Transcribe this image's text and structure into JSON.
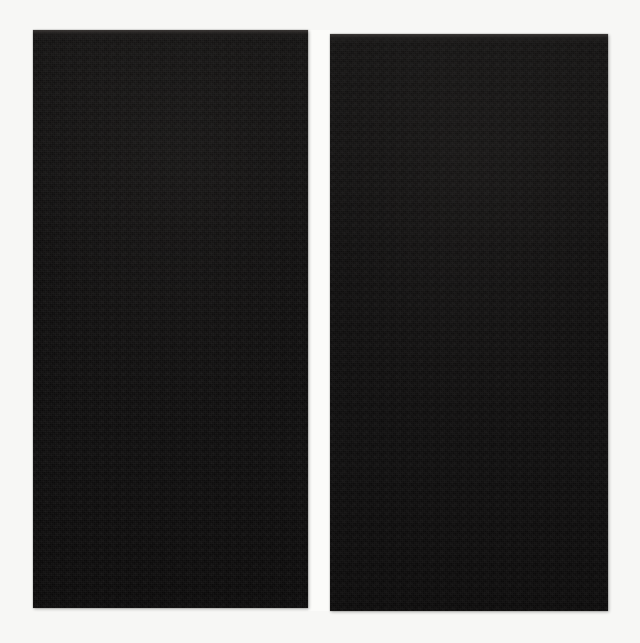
{
  "canvas": {
    "width": 640,
    "height": 643,
    "background_color": "#f7f7f5"
  },
  "scene": {
    "description": "Two tall near-black rectangular panels placed side by side on a plain off-white background, separated by a narrow white vertical gutter.",
    "panel_count": 2,
    "panel_fill_color": "#0d0c0c",
    "gutter_color": "#fbfbf9",
    "visible_text": ""
  },
  "panels": [
    {
      "id": "left",
      "label": "",
      "fill_color": "#0d0c0c",
      "top_edge_highlight_color": "#3e3a38",
      "content": "",
      "x": 33,
      "y": 30,
      "width": 275,
      "height": 578
    },
    {
      "id": "right",
      "label": "",
      "fill_color": "#0d0c0c",
      "top_edge_highlight_color": "#3e3a38",
      "content": "",
      "x": 330,
      "y": 34,
      "width": 278,
      "height": 577
    }
  ]
}
